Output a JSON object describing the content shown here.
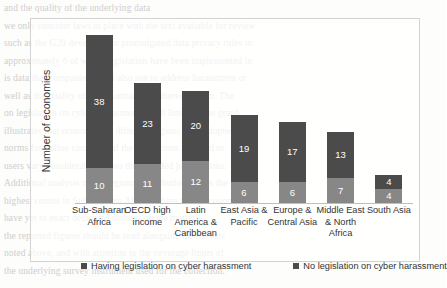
{
  "page_background": {
    "bleed_lines": [
      "and the quality of the underlying data",
      "we only consider laws in place with the text available for review",
      "such as the G20 developed or promulgated data privacy rules in",
      "approximately 6 of which legislation have been implemented in",
      "is data that companies could also use to address harassment or",
      "well as the quality of the information gathered therein. The",
      "on legislation on cyber harassment is still limited. The graph",
      "illustrates that economies in different regions have adopted",
      "norms for online conduct and the protections afforded to",
      "users vary considerably across the included jurisdictions.",
      "Additional analysis of the regional distribution shows the",
      "highest counts in Sub-Saharan Africa, where many economies",
      "have yet to enact dedicated statutes on the matter.",
      "the reported figures should be read alongside the caveats",
      "noted above, and with attention to the coverage limits of",
      "the underlying survey instrument used for the collection."
    ]
  },
  "chart_data": {
    "type": "bar",
    "subtype": "stacked-bar",
    "title": "",
    "xlabel": "",
    "ylabel": "Number of economies",
    "ylim": [
      0,
      48
    ],
    "grid": false,
    "legend_position": "bottom",
    "categories": [
      "Sub-Saharan Africa",
      "OECD high income",
      "Latin America & Caribbean",
      "East Asia & Pacific",
      "Europe & Central Asia",
      "Middle East & North Africa",
      "South Asia"
    ],
    "category_lines": [
      [
        "Sub-Saharan",
        "Africa"
      ],
      [
        "OECD high",
        "income"
      ],
      [
        "Latin",
        "America &",
        "Caribbean"
      ],
      [
        "East Asia &",
        "Pacific"
      ],
      [
        "Europe &",
        "Central Asia"
      ],
      [
        "Middle East",
        "& North",
        "Africa"
      ],
      [
        "South Asia"
      ]
    ],
    "series": [
      {
        "name": "Having legislation on cyber harassment",
        "color": "#878787",
        "stack_position": "bottom",
        "values": [
          10,
          11,
          12,
          6,
          6,
          7,
          4
        ]
      },
      {
        "name": "No legislation on cyber harassment",
        "color": "#4b4b4b",
        "stack_position": "top",
        "values": [
          38,
          23,
          20,
          19,
          17,
          13,
          4
        ]
      }
    ],
    "totals": [
      48,
      34,
      32,
      25,
      23,
      20,
      8
    ]
  },
  "legend": {
    "items": [
      {
        "label": "Having legislation on cyber harassment",
        "color": "#4b4b4b"
      },
      {
        "label": "No legislation on cyber harassment",
        "color": "#4b4b4b"
      }
    ]
  }
}
